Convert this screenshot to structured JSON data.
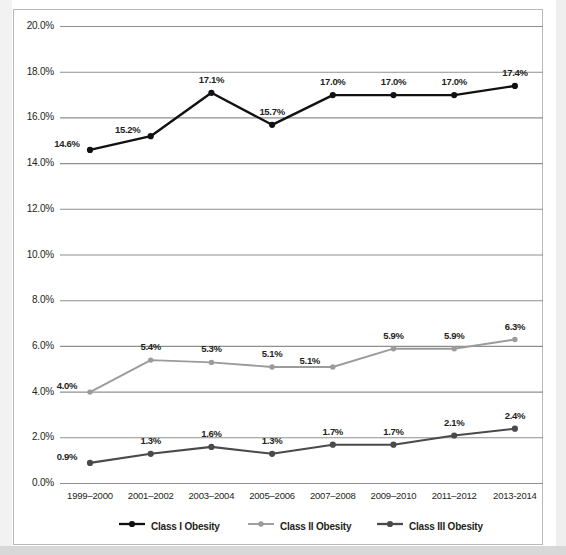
{
  "chart_data": {
    "type": "line",
    "title": "",
    "subtitle": "",
    "xlabel": "",
    "ylabel": "",
    "grid": true,
    "legend_position": "bottom",
    "ylim": [
      0,
      20
    ],
    "ytick_labels": [
      "20.0%",
      "18.0%",
      "16.0%",
      "14.0%",
      "12.0%",
      "10.0%",
      "8.0%",
      "6.0%",
      "4.0%",
      "2.0%",
      "0.0%"
    ],
    "ytick_values": [
      20,
      18,
      16,
      14,
      12,
      10,
      8,
      6,
      4,
      2,
      0
    ],
    "categories": [
      "1999–2000",
      "2001–2002",
      "2003–2004",
      "2005–2006",
      "2007–2008",
      "2009–2010",
      "2011–2012",
      "2013-2014"
    ],
    "series": [
      {
        "name": "Class I Obesity",
        "color": "#111111",
        "values": [
          14.6,
          15.2,
          17.1,
          15.7,
          17.0,
          17.0,
          17.0,
          17.4
        ],
        "labels": [
          "14.6%",
          "15.2%",
          "17.1%",
          "15.7%",
          "17.0%",
          "17.0%",
          "17.0%",
          "17.4%"
        ],
        "label_side": [
          "left",
          "left",
          "above",
          "above",
          "above",
          "above",
          "above",
          "above"
        ]
      },
      {
        "name": "Class II Obesity",
        "color": "#9b9b9b",
        "values": [
          4.0,
          5.4,
          5.3,
          5.1,
          5.1,
          5.9,
          5.9,
          6.3
        ],
        "labels": [
          "4.0%",
          "5.4%",
          "5.3%",
          "5.1%",
          "5.1%",
          "5.9%",
          "5.9%",
          "6.3%"
        ],
        "label_side": [
          "left",
          "above",
          "above",
          "above",
          "left",
          "above",
          "above",
          "above"
        ]
      },
      {
        "name": "Class III Obesity",
        "color": "#4a4a4a",
        "values": [
          0.9,
          1.3,
          1.6,
          1.3,
          1.7,
          1.7,
          2.1,
          2.4
        ],
        "labels": [
          "0.9%",
          "1.3%",
          "1.6%",
          "1.3%",
          "1.7%",
          "1.7%",
          "2.1%",
          "2.4%"
        ],
        "label_side": [
          "left",
          "above",
          "above",
          "above",
          "above",
          "above",
          "above",
          "above"
        ]
      }
    ],
    "colors": {
      "gridline": "#8f8f8f",
      "frame": "#b9b9b9",
      "text": "#231f20",
      "class_i": "#111111",
      "class_ii": "#9b9b9b",
      "class_iii": "#4a4a4a"
    }
  }
}
